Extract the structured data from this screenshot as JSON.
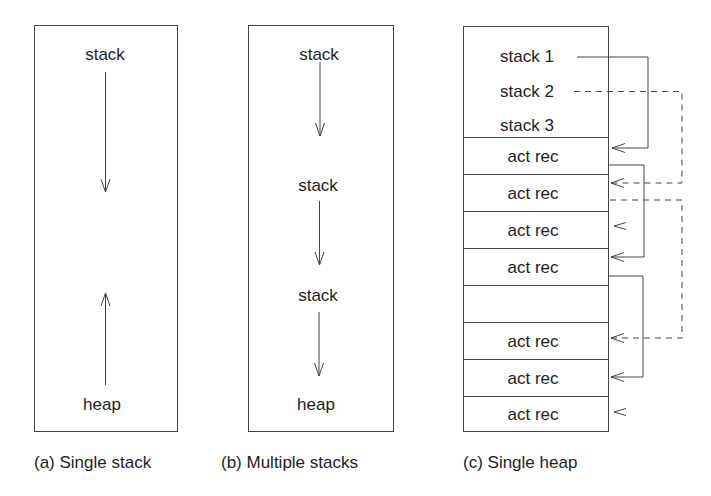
{
  "panels": [
    {
      "id": "a",
      "caption": "(a) Single stack",
      "labels": {
        "top": "stack",
        "bottom": "heap"
      }
    },
    {
      "id": "b",
      "caption": "(b) Multiple stacks",
      "labels": {
        "stack1": "stack",
        "stack2": "stack",
        "stack3": "stack",
        "heap": "heap"
      }
    },
    {
      "id": "c",
      "caption": "(c) Single heap",
      "header_labels": [
        "stack 1",
        "stack 2",
        "stack 3"
      ],
      "cells": [
        "act rec",
        "act rec",
        "act rec",
        "act rec",
        "",
        "act rec",
        "act rec",
        "act rec"
      ]
    }
  ],
  "colors": {
    "line": "#444444",
    "text": "#1e1e1e",
    "background": "#ffffff"
  }
}
